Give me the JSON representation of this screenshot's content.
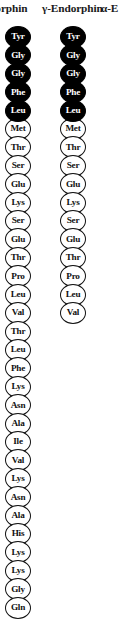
{
  "figure": {
    "background_color": "#ffffff",
    "filled_residue_color": "#000000",
    "open_residue_color": "#ffffff",
    "outline_color": "#111111",
    "filled_text_color": "#ffffff",
    "open_text_color": "#111111"
  },
  "headers": {
    "beta": "ndorphin",
    "gamma": "γ-Endorphin",
    "alpha": "α-E"
  },
  "chart_data": {
    "type": "diagram",
    "columns": [
      {
        "name": "beta-endorphin",
        "header": "ndorphin",
        "cropped_left": true,
        "residues": [
          {
            "label": "Tyr",
            "style": "filled"
          },
          {
            "label": "Gly",
            "style": "filled"
          },
          {
            "label": "Gly",
            "style": "filled"
          },
          {
            "label": "Phe",
            "style": "filled"
          },
          {
            "label": "Leu",
            "style": "filled"
          },
          {
            "label": "Met",
            "style": "open"
          },
          {
            "label": "Thr",
            "style": "open"
          },
          {
            "label": "Ser",
            "style": "open"
          },
          {
            "label": "Glu",
            "style": "open"
          },
          {
            "label": "Lys",
            "style": "open"
          },
          {
            "label": "Ser",
            "style": "open"
          },
          {
            "label": "Glu",
            "style": "open"
          },
          {
            "label": "Thr",
            "style": "open"
          },
          {
            "label": "Pro",
            "style": "open"
          },
          {
            "label": "Leu",
            "style": "open"
          },
          {
            "label": "Val",
            "style": "open"
          },
          {
            "label": "Thr",
            "style": "open"
          },
          {
            "label": "Leu",
            "style": "open"
          },
          {
            "label": "Phe",
            "style": "open"
          },
          {
            "label": "Lys",
            "style": "open"
          },
          {
            "label": "Asn",
            "style": "open"
          },
          {
            "label": "Ala",
            "style": "open"
          },
          {
            "label": "Ile",
            "style": "open"
          },
          {
            "label": "Val",
            "style": "open"
          },
          {
            "label": "Lys",
            "style": "open"
          },
          {
            "label": "Asn",
            "style": "open"
          },
          {
            "label": "Ala",
            "style": "open"
          },
          {
            "label": "His",
            "style": "open"
          },
          {
            "label": "Lys",
            "style": "open"
          },
          {
            "label": "Lys",
            "style": "open"
          },
          {
            "label": "Gly",
            "style": "open"
          },
          {
            "label": "Gln",
            "style": "open"
          }
        ]
      },
      {
        "name": "gamma-endorphin",
        "header": "γ-Endorphin",
        "cropped_left": false,
        "residues": [
          {
            "label": "Tyr",
            "style": "filled"
          },
          {
            "label": "Gly",
            "style": "filled"
          },
          {
            "label": "Gly",
            "style": "filled"
          },
          {
            "label": "Phe",
            "style": "filled"
          },
          {
            "label": "Leu",
            "style": "filled"
          },
          {
            "label": "Met",
            "style": "open"
          },
          {
            "label": "Thr",
            "style": "open"
          },
          {
            "label": "Ser",
            "style": "open"
          },
          {
            "label": "Glu",
            "style": "open"
          },
          {
            "label": "Lys",
            "style": "open"
          },
          {
            "label": "Ser",
            "style": "open"
          },
          {
            "label": "Glu",
            "style": "open"
          },
          {
            "label": "Thr",
            "style": "open"
          },
          {
            "label": "Pro",
            "style": "open"
          },
          {
            "label": "Leu",
            "style": "open"
          },
          {
            "label": "Val",
            "style": "open"
          }
        ]
      },
      {
        "name": "alpha-endorphin",
        "header": "α-E",
        "cropped_right": true,
        "residues": []
      }
    ]
  }
}
